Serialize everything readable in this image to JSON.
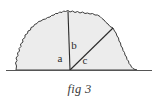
{
  "figure": {
    "caption": "fig 3",
    "labels": {
      "a": "a",
      "b": "b",
      "c": "c"
    },
    "colors": {
      "background": "#ffffff",
      "mound_fill": "#ececec",
      "outline": "#3c3c3c",
      "baseline": "#555555",
      "label_text": "#2b2b2b",
      "caption_text": "#3a3a3a"
    },
    "geometry": {
      "baseline_y": 70,
      "baseline_x_start": 6,
      "baseline_x_end": 152,
      "apex": {
        "x": 68,
        "y": 11
      },
      "vertex": {
        "x": 70,
        "y": 70
      },
      "secondary_peak": {
        "x": 113,
        "y": 28
      },
      "mound_left_base_x": 16,
      "mound_right_base_x": 137
    },
    "label_positions": {
      "a": {
        "x": 60,
        "y": 62
      },
      "b": {
        "x": 73,
        "y": 49
      },
      "c": {
        "x": 82,
        "y": 64
      }
    }
  }
}
